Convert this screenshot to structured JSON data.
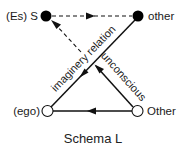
{
  "diagram": {
    "title": "Schema L",
    "colors": {
      "stroke": "#111111",
      "filled_node": "#000000",
      "hollow_node_fill": "#ffffff",
      "text": "#1a1a1a"
    },
    "nodes": [
      {
        "id": "S",
        "label": "(Es) S",
        "style": "filled",
        "position": "top-left"
      },
      {
        "id": "other",
        "label": "other",
        "style": "filled",
        "position": "top-right"
      },
      {
        "id": "ego",
        "label": "(ego)",
        "style": "hollow",
        "position": "bottom-left"
      },
      {
        "id": "Other",
        "label": "Other",
        "style": "hollow",
        "position": "bottom-right"
      }
    ],
    "edges": [
      {
        "from": "S",
        "to": "other",
        "style": "dashed",
        "arrow": "toward other"
      },
      {
        "from": "other",
        "to": "ego",
        "style": "solid",
        "arrow": "toward ego",
        "label": "imaginery relation"
      },
      {
        "from": "Other",
        "to": "center",
        "style": "solid",
        "arrow": "toward center",
        "label": "unconscious"
      },
      {
        "from": "center",
        "to": "S",
        "style": "dashed",
        "arrow": "toward S"
      },
      {
        "from": "Other",
        "to": "ego",
        "style": "solid",
        "arrow": "toward ego"
      }
    ],
    "edge_labels": {
      "imaginary": "imaginery relation",
      "unconscious": "unconscious"
    }
  }
}
